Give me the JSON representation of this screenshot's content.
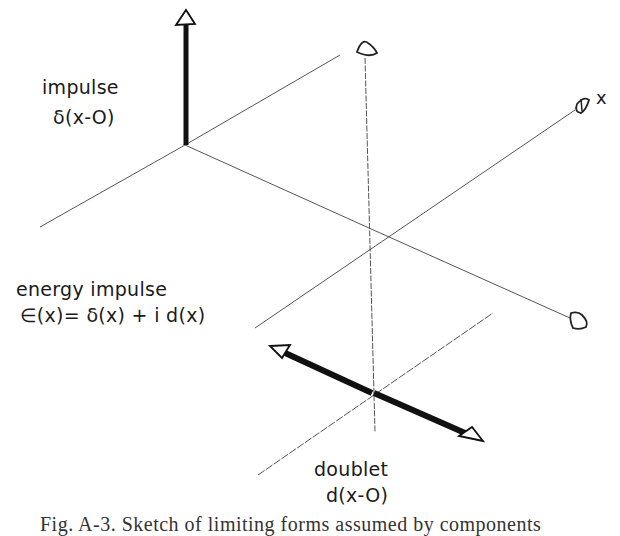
{
  "figure": {
    "labels": {
      "impulse_title": "impulse",
      "impulse_formula": "δ(x-O)",
      "energy_title": "energy   impulse",
      "energy_formula": "∈(x)= δ(x) + i d(x)",
      "doublet_title": "doublet",
      "doublet_formula": "d(x-O)",
      "x_axis": "x"
    },
    "caption": "Fig. A-3. Sketch of limiting forms assumed by components",
    "colors": {
      "ink": "#111111",
      "thin_line": "#555555",
      "background": "#ffffff"
    }
  }
}
